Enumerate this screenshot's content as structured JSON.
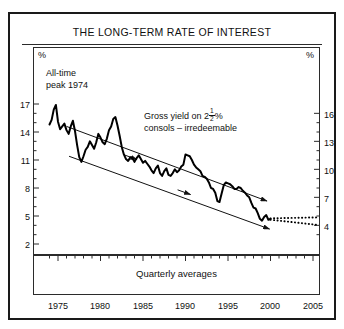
{
  "figure": {
    "title": "THE LONG-TERM RATE OF INTEREST",
    "left_unit": "%",
    "right_unit": "%",
    "footer_note": "Quarterly averages"
  },
  "annotations": {
    "peak": {
      "line1": "All-time",
      "line2": "peak 1974"
    },
    "series_label": {
      "line1_pre": "Gross yield on 2",
      "frac_num": "1",
      "frac_den": "2",
      "line1_post": "%",
      "line2": "consols – irredeemable"
    }
  },
  "chart_data": {
    "type": "line",
    "title": "THE LONG-TERM RATE OF INTEREST",
    "subtitle": "Gross yield on 2½% consols – irredeemable",
    "xlabel": "",
    "ylabel": "%",
    "note": "Quarterly averages",
    "grid": false,
    "legend": "none",
    "xlim": [
      1973.5,
      2006.0
    ],
    "ylim_left": [
      2,
      17
    ],
    "ylim_right": [
      4,
      16
    ],
    "xticks": [
      1975,
      1980,
      1985,
      1990,
      1995,
      2000,
      2005
    ],
    "yticks_left": [
      17,
      14,
      11,
      8,
      5,
      2
    ],
    "yticks_right": [
      16,
      13,
      10,
      7,
      4
    ],
    "yticks_left_minor_step": 1,
    "yticks_right_minor_step": 1,
    "series": [
      {
        "name": "Gross yield on 2½% consols – irredeemable",
        "style": "solid",
        "x": [
          1974.0,
          1974.25,
          1974.5,
          1974.75,
          1975.0,
          1975.25,
          1975.5,
          1975.75,
          1976.0,
          1976.25,
          1976.5,
          1976.75,
          1977.0,
          1977.25,
          1977.5,
          1977.75,
          1978.0,
          1978.25,
          1978.5,
          1978.75,
          1979.0,
          1979.25,
          1979.5,
          1979.75,
          1980.0,
          1980.25,
          1980.5,
          1980.75,
          1981.0,
          1981.25,
          1981.5,
          1981.75,
          1982.0,
          1982.25,
          1982.5,
          1982.75,
          1983.0,
          1983.25,
          1983.5,
          1983.75,
          1984.0,
          1984.25,
          1984.5,
          1984.75,
          1985.0,
          1985.25,
          1985.5,
          1985.75,
          1986.0,
          1986.25,
          1986.5,
          1986.75,
          1987.0,
          1987.25,
          1987.5,
          1987.75,
          1988.0,
          1988.25,
          1988.5,
          1988.75,
          1989.0,
          1989.25,
          1989.5,
          1989.75,
          1990.0,
          1990.25,
          1990.5,
          1990.75,
          1991.0,
          1991.25,
          1991.5,
          1991.75,
          1992.0,
          1992.25,
          1992.5,
          1992.75,
          1993.0,
          1993.25,
          1993.5,
          1993.75,
          1994.0,
          1994.25,
          1994.5,
          1994.75,
          1995.0,
          1995.25,
          1995.5,
          1995.75,
          1996.0,
          1996.25,
          1996.5,
          1996.75,
          1997.0,
          1997.25,
          1997.5,
          1997.75,
          1998.0,
          1998.25,
          1998.5,
          1998.75,
          1999.0,
          1999.25,
          1999.5,
          1999.75,
          2000.0
        ],
        "y": [
          14.8,
          15.3,
          16.4,
          16.9,
          15.1,
          14.3,
          14.6,
          14.9,
          14.2,
          13.8,
          14.6,
          15.2,
          14.1,
          12.6,
          11.3,
          10.8,
          11.4,
          12.1,
          12.4,
          13.0,
          12.6,
          12.2,
          12.9,
          13.8,
          13.4,
          12.9,
          12.7,
          13.3,
          14.2,
          14.6,
          15.4,
          15.6,
          14.7,
          13.6,
          12.4,
          11.6,
          11.1,
          10.9,
          11.3,
          11.2,
          10.8,
          11.2,
          11.5,
          11.1,
          10.7,
          10.9,
          10.6,
          10.3,
          9.9,
          9.6,
          10.1,
          10.4,
          9.6,
          9.3,
          9.8,
          10.1,
          9.4,
          9.3,
          9.6,
          10.0,
          9.7,
          9.9,
          10.3,
          10.5,
          11.6,
          11.5,
          11.4,
          11.0,
          10.5,
          10.2,
          10.0,
          9.8,
          9.3,
          9.2,
          9.0,
          8.6,
          8.0,
          7.9,
          7.5,
          6.6,
          6.5,
          7.4,
          8.3,
          8.6,
          8.5,
          8.4,
          8.2,
          7.9,
          7.9,
          8.1,
          8.0,
          7.7,
          7.5,
          7.2,
          7.0,
          6.4,
          5.9,
          5.8,
          5.3,
          4.7,
          4.5,
          4.9,
          5.1,
          4.6,
          4.7
        ]
      },
      {
        "name": "projection upper",
        "style": "dotted",
        "x": [
          2000.0,
          2005.5
        ],
        "y": [
          4.75,
          4.85
        ]
      },
      {
        "name": "projection lower",
        "style": "dotted",
        "x": [
          2000.0,
          2005.5
        ],
        "y": [
          4.6,
          4.05
        ]
      }
    ],
    "trend_channel": {
      "description": "Two parallel downward-sloping arrowed trend lines forming a declining channel",
      "upper": {
        "x": [
          1976.0,
          1999.6
        ],
        "y": [
          14.6,
          6.6
        ],
        "arrow": "end"
      },
      "lower": {
        "x": [
          1976.3,
          1999.9
        ],
        "y": [
          11.4,
          3.6
        ],
        "arrow": "end"
      },
      "mid_arrows": [
        {
          "x": 1984.3,
          "y": 11.05
        },
        {
          "x": 1990.6,
          "y": 7.3
        }
      ]
    }
  }
}
